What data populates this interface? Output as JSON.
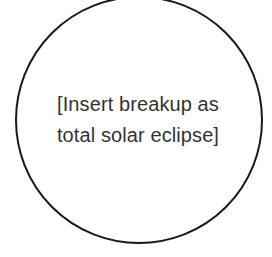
{
  "diagram": {
    "shape": "circle",
    "stroke_color": "#1a1a1a",
    "text_color": "#333333",
    "placeholder_lines": [
      "[Insert breakup as",
      "total solar eclipse]"
    ]
  }
}
